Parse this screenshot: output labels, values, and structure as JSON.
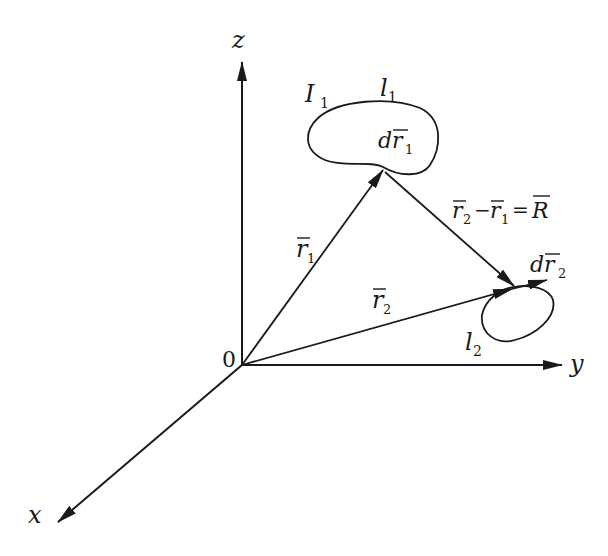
{
  "diagram": {
    "type": "vector-diagram",
    "axes": {
      "x": "x",
      "y": "y",
      "z": "z",
      "origin": "0"
    },
    "loop1": {
      "current_label": "I",
      "current_sub": "1",
      "contour_label": "l",
      "contour_sub": "1",
      "element_label": "dr",
      "element_sub": "1"
    },
    "loop2": {
      "contour_label": "l",
      "contour_sub": "2",
      "element_label": "dr",
      "element_sub": "2"
    },
    "vectors": {
      "r1": {
        "label": "r",
        "sub": "1"
      },
      "r2": {
        "label": "r",
        "sub": "2"
      },
      "R_equation": {
        "a": "r",
        "a_sub": "2",
        "minus": "−",
        "b": "r",
        "b_sub": "1",
        "eq": "=",
        "result": "R"
      }
    },
    "colors": {
      "stroke": "#1a1a1a",
      "background": "#ffffff"
    }
  }
}
